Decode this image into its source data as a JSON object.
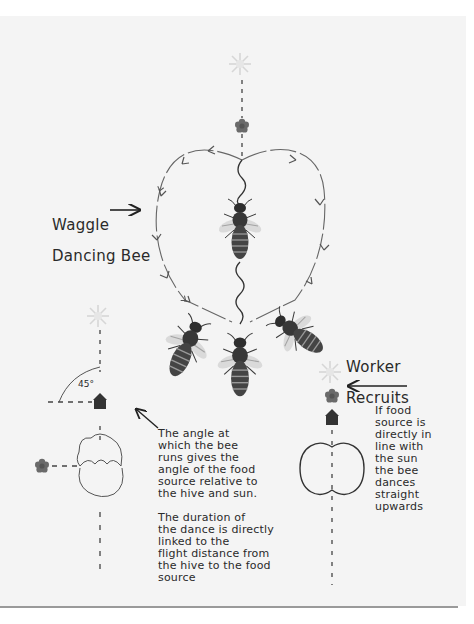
{
  "diagram": {
    "labels": {
      "waggle_dancing_bee_line1": "Waggle",
      "waggle_dancing_bee_line2": "Dancing Bee",
      "worker_recruits_line1": "Worker",
      "worker_recruits_line2": "Recruits",
      "angle": "45°"
    },
    "notes": {
      "angle_note": "The angle at\nwhich the bee\nruns gives the\nangle of the food\nsource relative to\nthe hive and sun.",
      "duration_note": "The duration of\nthe dance is directly\nlinked to the\nflight distance from\nthe hive to the food\n source",
      "upwards_note": "If food\nsource is\ndirectly in\nline with\nthe sun\nthe bee\ndances\nstraight\n upwards"
    },
    "colors": {
      "paper": "#f4f4f4",
      "ink": "#2a2a2a",
      "flower": "#6a6a6a",
      "sun": "#d8d8d8",
      "bee_body": "#3a3a3a"
    }
  }
}
